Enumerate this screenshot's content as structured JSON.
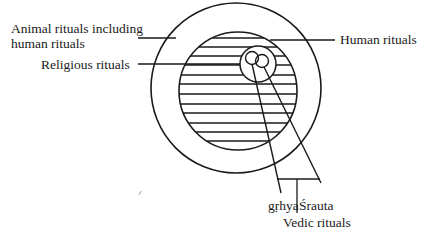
{
  "diagram": {
    "type": "nested-circles",
    "labels": {
      "animal_line1": "Animal rituals including",
      "animal_line2": "human rituals",
      "religious": "Religious rituals",
      "human": "Human rituals",
      "grhya": "gṛhya",
      "srauta": "Śrauta",
      "vedic": "Vedic rituals"
    },
    "nodes": [
      {
        "id": "outer-circle",
        "label": "Animal rituals including human rituals"
      },
      {
        "id": "inner-hatched-circle",
        "label": "Human rituals"
      },
      {
        "id": "small-circle",
        "label": "Religious rituals"
      },
      {
        "id": "tiny-circle-left",
        "label": "gṛhya"
      },
      {
        "id": "tiny-circle-right",
        "label": "Śrauta"
      }
    ],
    "group_label": "Vedic rituals",
    "colors": {
      "stroke": "#1a1a1a",
      "background": "#ffffff"
    }
  }
}
